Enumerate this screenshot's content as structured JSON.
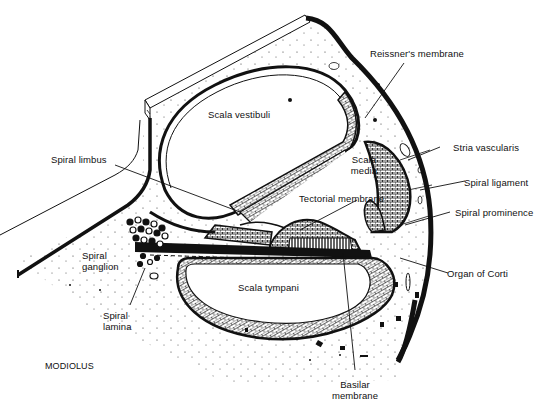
{
  "figure": {
    "regions": {
      "scala_vestibuli": "Scala vestibuli",
      "scala_media_line1": "Scala",
      "scala_media_line2": "media",
      "scala_tympani": "Scala tympani",
      "modiolus": "MODIOLUS"
    },
    "labels": {
      "reissners_membrane": "Reissner's membrane",
      "stria_vascularis": "Stria vascularis",
      "spiral_limbus": "Spiral limbus",
      "spiral_ligament": "Spiral ligament",
      "tectorial_membrane": "Tectorial membrane",
      "spiral_prominence": "Spiral prominence",
      "spiral_ganglion_line1": "Spiral",
      "spiral_ganglion_line2": "ganglion",
      "organ_of_corti": "Organ of Corti",
      "spiral_lamina_line1": "Spiral",
      "spiral_lamina_line2": "lamina",
      "basilar_membrane_line1": "Basilar",
      "basilar_membrane_line2": "membrane"
    },
    "colors": {
      "ink": "#111111",
      "background": "#ffffff"
    }
  }
}
